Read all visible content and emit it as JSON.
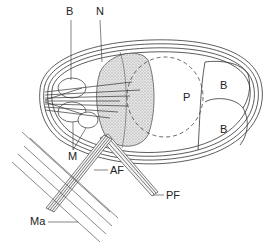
{
  "diagram": {
    "type": "biological cell schematic (flagellate)",
    "labels": {
      "B_top": "B",
      "N": "N",
      "P": "P",
      "B_right_top": "B",
      "B_right_bottom": "B",
      "M": "M",
      "AF": "AF",
      "PF": "PF",
      "Ma": "Ma"
    },
    "colors": {
      "line": "#333333",
      "stipple": "#b8b8b8",
      "background": "#ffffff"
    }
  }
}
